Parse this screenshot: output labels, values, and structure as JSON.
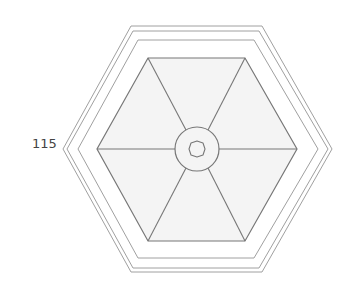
{
  "diagram": {
    "label": "115",
    "colors": {
      "outline": "#9a9a9a",
      "inner_line": "#777777",
      "fill": "#f2f2f2"
    },
    "outer_hexagons": [
      {
        "points": "131,26 262,26 332,149 262,272 131,272 63,149"
      },
      {
        "points": "133,31 259,31 328,149 259,268 133,268 67,149"
      },
      {
        "points": "138,40 254,40 318,149 254,258 138,258 78,149"
      }
    ],
    "inner_hexagon": {
      "points": "148,58 245,58 297,149 245,241 148,241 97,149"
    },
    "center": {
      "cx": 197,
      "cy": 149,
      "ring_r": 22
    }
  }
}
